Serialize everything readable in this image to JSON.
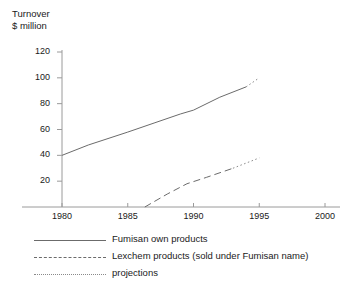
{
  "chart_data": {
    "type": "line",
    "xlabel": "",
    "ylabel": "Turnover $ million",
    "xlim": [
      1978,
      2000
    ],
    "ylim": [
      0,
      120
    ],
    "xticks": [
      "1980",
      "1985",
      "1990",
      "1995",
      "2000"
    ],
    "xtick_values": [
      1980,
      1985,
      1990,
      1995,
      2000
    ],
    "yticks": [
      "20",
      "40",
      "60",
      "80",
      "100",
      "120"
    ],
    "ytick_values": [
      20,
      40,
      60,
      80,
      100,
      120
    ],
    "grid": false,
    "legend_position": "below",
    "series": [
      {
        "name": "Fumisan own products",
        "style": "solid",
        "x": [
          1980,
          1982,
          1985,
          1987,
          1989,
          1990,
          1992,
          1994
        ],
        "values": [
          40,
          48,
          58,
          65,
          72,
          75,
          85,
          93
        ]
      },
      {
        "name": "Fumisan own products projection",
        "style": "dotted",
        "x": [
          1994,
          1995
        ],
        "values": [
          93,
          100
        ]
      },
      {
        "name": "Lexchem products (sold under Fumisan name)",
        "style": "dashed",
        "x": [
          1986.3,
          1988,
          1989.5,
          1991,
          1993
        ],
        "values": [
          0,
          10,
          18,
          23,
          30
        ]
      },
      {
        "name": "Lexchem products projection",
        "style": "dotted",
        "x": [
          1993,
          1995
        ],
        "values": [
          30,
          38
        ]
      }
    ]
  },
  "legend": {
    "items": [
      {
        "label": "Fumisan own products",
        "style": "solid"
      },
      {
        "label": "Lexchem products (sold under Fumisan name)",
        "style": "dashed"
      },
      {
        "label": "projections",
        "style": "dotted"
      }
    ]
  },
  "axis": {
    "title_line1": "Turnover",
    "title_line2": "$ million"
  }
}
